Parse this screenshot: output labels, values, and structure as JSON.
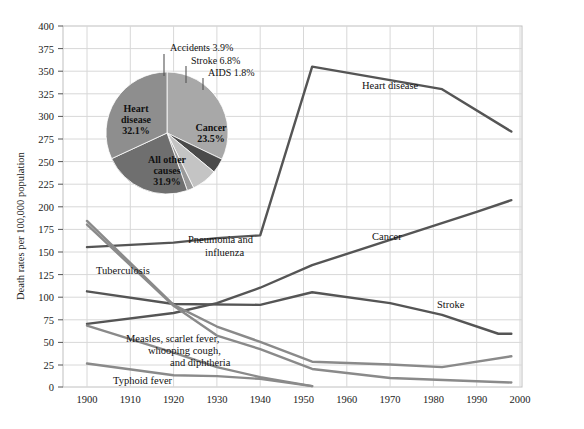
{
  "chart_data": {
    "type": "line",
    "title": "",
    "xlabel": "",
    "ylabel": "Death rates per 100,000 population",
    "xlim": [
      1900,
      2000
    ],
    "ylim": [
      0,
      400
    ],
    "grid": true,
    "legend": "inline-labels",
    "xticks": [
      "1900",
      "1910",
      "1920",
      "1930",
      "1940",
      "1950",
      "1960",
      "1970",
      "1980",
      "1990",
      "2000"
    ],
    "yticks": [
      "0",
      "25",
      "50",
      "75",
      "100",
      "125",
      "150",
      "175",
      "200",
      "225",
      "250",
      "275",
      "300",
      "325",
      "350",
      "375",
      "400"
    ],
    "series": [
      {
        "name": "Heart disease",
        "label": "Heart disease",
        "color": "#555555",
        "x": [
          1900,
          1920,
          1930,
          1940,
          1952,
          1982,
          1998
        ],
        "values": [
          155,
          160,
          165,
          168,
          355,
          330,
          283
        ]
      },
      {
        "name": "Cancer",
        "label": "Cancer",
        "color": "#555555",
        "x": [
          1900,
          1920,
          1930,
          1940,
          1952,
          1970,
          1990,
          1998
        ],
        "values": [
          70,
          82,
          93,
          110,
          135,
          163,
          194,
          207
        ]
      },
      {
        "name": "Stroke",
        "label": "Stroke",
        "color": "#555555",
        "x": [
          1900,
          1920,
          1940,
          1952,
          1970,
          1982,
          1995,
          1998
        ],
        "values": [
          106,
          92,
          91,
          105,
          93,
          80,
          59,
          59
        ]
      },
      {
        "name": "Pneumonia and influenza",
        "label": "Pneumonia and influenza",
        "color": "#8a8a8a",
        "x": [
          1900,
          1920,
          1930,
          1940,
          1952,
          1970,
          1982,
          1998
        ],
        "values": [
          184,
          91,
          67,
          50,
          28,
          25,
          22,
          34
        ]
      },
      {
        "name": "Tuberculosis",
        "label": "Tuberculosis",
        "color": "#8a8a8a",
        "x": [
          1900,
          1920,
          1930,
          1940,
          1952,
          1970,
          1998
        ],
        "values": [
          180,
          90,
          57,
          42,
          20,
          10,
          5
        ]
      },
      {
        "name": "Measles, scarlet fever, whooping cough, and diphtheria",
        "label": "Measles, scarlet fever,\nwhooping cough,\nand diphtheria",
        "color": "#8a8a8a",
        "x": [
          1900,
          1920,
          1930,
          1940,
          1952
        ],
        "values": [
          68,
          38,
          22,
          11,
          1
        ]
      },
      {
        "name": "Typhoid fever",
        "label": "Typhoid fever",
        "color": "#8a8a8a",
        "x": [
          1900,
          1920,
          1930,
          1940,
          1952
        ],
        "values": [
          26,
          13,
          12,
          9,
          1
        ]
      }
    ],
    "inset_pie": {
      "type": "pie",
      "title": "",
      "slices": [
        {
          "label": "Heart disease",
          "value": 32.1,
          "display": "Heart\ndisease\n32.1%",
          "color": "#a8a8a8",
          "placement": "inside"
        },
        {
          "label": "Accidents",
          "value": 3.9,
          "display": "Accidents 3.9%",
          "color": "#4a4a4a",
          "placement": "callout"
        },
        {
          "label": "Stroke",
          "value": 6.8,
          "display": "Stroke 6.8%",
          "color": "#c4c4c4",
          "placement": "callout"
        },
        {
          "label": "AIDS",
          "value": 1.8,
          "display": "AIDS 1.8%",
          "color": "#9a9a9a",
          "placement": "callout"
        },
        {
          "label": "Cancer",
          "value": 23.5,
          "display": "Cancer\n23.5%",
          "color": "#6f6f6f",
          "placement": "inside"
        },
        {
          "label": "All other causes",
          "value": 31.9,
          "display": "All other\ncauses\n31.9%",
          "color": "#8e8e8e",
          "placement": "inside"
        }
      ]
    }
  },
  "labels": {
    "ylabel": "Death rates per 100,000 population",
    "heart_disease": "Heart disease",
    "cancer": "Cancer",
    "stroke": "Stroke",
    "pneumonia_1": "Pneumonia and",
    "pneumonia_2": "influenza",
    "tuberculosis": "Tuberculosis",
    "measles_1": "Measles, scarlet fever,",
    "measles_2": "whooping cough,",
    "measles_3": "and diphtheria",
    "typhoid": "Typhoid fever",
    "pie_heart_1": "Heart",
    "pie_heart_2": "disease",
    "pie_heart_3": "32.1%",
    "pie_cancer_1": "Cancer",
    "pie_cancer_2": "23.5%",
    "pie_other_1": "All other",
    "pie_other_2": "causes",
    "pie_other_3": "31.9%",
    "pie_accidents": "Accidents 3.9%",
    "pie_stroke": "Stroke 6.8%",
    "pie_aids": "AIDS 1.8%"
  },
  "xticks": {
    "t0": "1900",
    "t1": "1910",
    "t2": "1920",
    "t3": "1930",
    "t4": "1940",
    "t5": "1950",
    "t6": "1960",
    "t7": "1970",
    "t8": "1980",
    "t9": "1990",
    "t10": "2000"
  },
  "yticks": {
    "y0": "0",
    "y1": "25",
    "y2": "50",
    "y3": "75",
    "y4": "100",
    "y5": "125",
    "y6": "150",
    "y7": "175",
    "y8": "200",
    "y9": "225",
    "y10": "250",
    "y11": "275",
    "y12": "300",
    "y13": "325",
    "y14": "350",
    "y15": "375",
    "y16": "400"
  },
  "colors": {
    "dark_line": "#555555",
    "light_line": "#8a8a8a",
    "grid": "#d8d8d8",
    "frame": "#c0c0c0"
  }
}
